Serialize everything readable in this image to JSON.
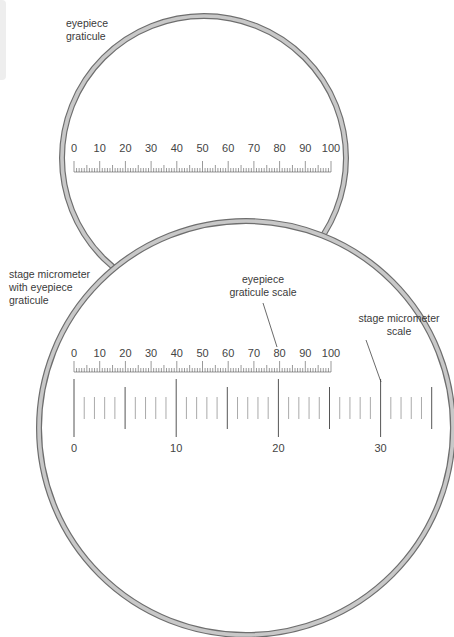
{
  "labels": {
    "eyepiece_graticule": "eyepiece\ngraticule",
    "stage_with_graticule": "stage micrometer\nwith eyepiece\ngraticule",
    "graticule_scale": "eyepiece\ngraticule scale",
    "stage_scale": "stage micrometer\nscale"
  },
  "colors": {
    "ring_fill": "#c8c8c8",
    "ring_edge": "#6e6e6e",
    "tick": "#555555",
    "stage_tick_minor": "#aaaaaa",
    "leader": "#444444"
  },
  "small_circle": {
    "cx": 204,
    "cy": 158,
    "r": 142
  },
  "big_circle": {
    "cx": 246,
    "cy": 428,
    "r": 207
  },
  "eyepiece_scale_top": {
    "x0": 74,
    "x100": 331,
    "baseline_y": 172,
    "label_y": 152,
    "labels": [
      "0",
      "10",
      "20",
      "30",
      "40",
      "50",
      "60",
      "70",
      "80",
      "90",
      "100"
    ]
  },
  "eyepiece_scale_bottom": {
    "x0": 74,
    "x100": 331,
    "baseline_y": 372,
    "label_y": 357,
    "labels": [
      "0",
      "10",
      "20",
      "30",
      "40",
      "50",
      "60",
      "70",
      "80",
      "90",
      "100"
    ]
  },
  "stage_scale": {
    "x0": 74,
    "unit_px": 10.22,
    "max": 35,
    "top_long": 379,
    "bottom_long": 437,
    "labels": [
      {
        "value": 0,
        "text": "0"
      },
      {
        "value": 10,
        "text": "10"
      },
      {
        "value": 20,
        "text": "20"
      },
      {
        "value": 30,
        "text": "30"
      }
    ],
    "label_y": 452
  },
  "leaders": [
    {
      "x1": 263,
      "y1": 303,
      "x2": 277,
      "y2": 347
    },
    {
      "x1": 366,
      "y1": 340,
      "x2": 381,
      "y2": 382
    }
  ]
}
